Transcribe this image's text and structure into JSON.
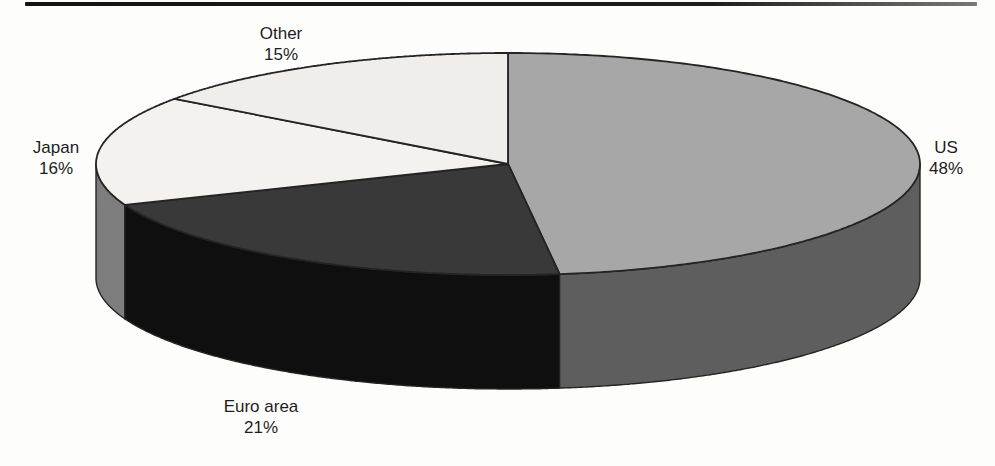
{
  "figure": {
    "background_color": "#fdfdfb",
    "top_rule_color": "#1a1a1a"
  },
  "chart_data": {
    "type": "pie",
    "style": "3d",
    "title": "",
    "unit": "%",
    "start_angle_deg": 0,
    "direction": "clockwise",
    "outline_color": "#242424",
    "legend_position": "labels-outside",
    "slices": [
      {
        "id": "us",
        "label": "US",
        "value": 48,
        "pct": "48%",
        "top_color": "#a7a7a7",
        "side_color": "#5e5e5e",
        "label_position": "right"
      },
      {
        "id": "euro-area",
        "label": "Euro area",
        "value": 21,
        "pct": "21%",
        "top_color": "#393939",
        "side_color": "#0f0f0f",
        "label_position": "bottom"
      },
      {
        "id": "japan",
        "label": "Japan",
        "value": 16,
        "pct": "16%",
        "top_color": "#f3f2ee",
        "side_color": "#7d7d7d",
        "label_position": "left"
      },
      {
        "id": "other",
        "label": "Other",
        "value": 15,
        "pct": "15%",
        "top_color": "#efeeea",
        "side_color": "#bdbdbd",
        "label_position": "top"
      }
    ]
  }
}
